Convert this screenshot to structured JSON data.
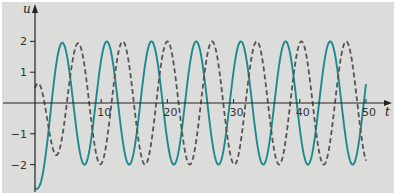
{
  "chart_data": {
    "type": "line",
    "title": "",
    "xlabel": "t",
    "ylabel": "u",
    "xlim": [
      0,
      50
    ],
    "ylim": [
      -2.8,
      2.8
    ],
    "grid": false,
    "legend": null,
    "x_ticks": [
      10,
      20,
      30,
      40,
      50
    ],
    "x_tick_labels": [
      "10",
      "20",
      "30",
      "40",
      "50"
    ],
    "y_ticks": [
      2,
      1,
      -1,
      -2
    ],
    "y_tick_labels": [
      "2",
      "1",
      "−1",
      "−2"
    ],
    "x": [
      0,
      1,
      2,
      3,
      4,
      5,
      6,
      7,
      8,
      9,
      10,
      11,
      12,
      13,
      14,
      15,
      16,
      17,
      18,
      19,
      20,
      21,
      22,
      23,
      24,
      25,
      26,
      27,
      28,
      29,
      30,
      31,
      32,
      33,
      34,
      35,
      36,
      37,
      38,
      39,
      40,
      41,
      42,
      43,
      44,
      45,
      46,
      47,
      48,
      49,
      50
    ],
    "series": [
      {
        "name": "u1 (solid)",
        "style": "solid",
        "color": "#1b8a8c",
        "values": [
          -2.76,
          -2.47,
          -0.99,
          0.93,
          1.94,
          1.32,
          -0.39,
          -1.81,
          -1.77,
          -0.3,
          1.41,
          1.99,
          0.96,
          -0.85,
          -1.96,
          -1.49,
          0.2,
          1.71,
          1.85,
          0.5,
          -1.25,
          -2.0,
          -1.14,
          0.64,
          1.9,
          1.63,
          0.1,
          -1.55,
          -1.93,
          -0.75,
          1.05,
          1.99,
          1.33,
          -0.4,
          -1.81,
          -1.76,
          -0.29,
          1.41,
          1.99,
          0.95,
          -0.86,
          -1.96,
          -1.49,
          0.21,
          1.71,
          1.85,
          0.49,
          -1.25,
          -2.0,
          -1.14,
          0.65
        ],
        "model": {
          "amp": 2,
          "omega": 0.9308,
          "t_peak": 4.1,
          "transient_amp": -1.2,
          "transient_rate": 0.8,
          "amp_deficit": 0,
          "amp_rate": 0
        }
      },
      {
        "name": "u2 (dashed)",
        "style": "dashed",
        "color": "#555555",
        "values": [
          0.49,
          0.43,
          -0.72,
          -1.65,
          -1.23,
          0.33,
          1.72,
          1.75,
          0.34,
          -1.36,
          -1.98,
          -0.99,
          0.79,
          1.95,
          1.54,
          -0.11,
          -1.67,
          -1.88,
          -0.57,
          1.19,
          2.0,
          1.2,
          -0.57,
          -1.87,
          -1.68,
          -0.12,
          1.54,
          1.95,
          0.8,
          -0.99,
          -1.99,
          -1.38,
          0.34,
          1.78,
          1.79,
          0.35,
          -1.37,
          -1.99,
          -1.0,
          0.79,
          1.95,
          1.54,
          -0.11,
          -1.67,
          -1.88,
          -0.57,
          1.19,
          2.0,
          1.2,
          -0.56,
          -1.87
        ],
        "model": {
          "amp": 2,
          "omega": 0.9308,
          "t_peak": 6.5,
          "transient_amp": 0,
          "transient_rate": 0,
          "amp_deficit": 1.5,
          "amp_rate": 0.5
        }
      }
    ],
    "layout": {
      "origin_px": [
        35,
        103
      ],
      "px_per_t": 6.62,
      "px_per_u": 30.8,
      "axis_x_end_px": 392,
      "axis_y_top_px": 4,
      "axis_y_bottom_px": 192
    }
  }
}
